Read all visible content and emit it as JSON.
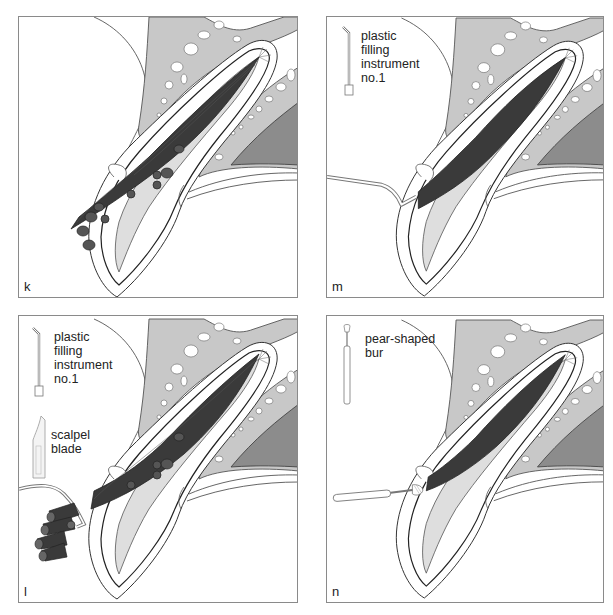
{
  "figure": {
    "colors": {
      "bone": "#c8c8c8",
      "bone_outline": "#555555",
      "sinus": "#8c8c8c",
      "tissue_dark": "#3a3a3a",
      "root_fill": "#dedede",
      "frame": "#8a8a8a",
      "text": "#222222"
    },
    "panels": [
      {
        "id": "k",
        "letter": "k",
        "position": "top-left",
        "instrument_labels": [],
        "content": "Bundle of dark cylindrical strands (gutta-percha cones) inserted along root canal, protruding from apex region"
      },
      {
        "id": "m",
        "letter": "m",
        "position": "top-right",
        "instrument_labels": [
          {
            "text": "plastic\nfilling\ninstrument\nno.1",
            "icon": "plastic-filling-instrument-icon"
          }
        ],
        "content": "Canal fully obturated (dark fill); plastic filling instrument inserted from left"
      },
      {
        "id": "l",
        "letter": "l",
        "position": "bottom-left",
        "instrument_labels": [
          {
            "text": "plastic\nfilling\ninstrument\nno.1",
            "icon": "plastic-filling-instrument-icon"
          },
          {
            "text": "scalpel\nblade",
            "icon": "scalpel-blade-icon"
          }
        ],
        "content": "Excess cones cut off and removed; cut cone pieces shown held by instrument at left"
      },
      {
        "id": "n",
        "letter": "n",
        "position": "bottom-right",
        "instrument_labels": [
          {
            "text": "pear-shaped\nbur",
            "icon": "pear-shaped-bur-icon"
          }
        ],
        "content": "Pear-shaped bur preparing the access at the canal opening; canal filled"
      }
    ]
  }
}
